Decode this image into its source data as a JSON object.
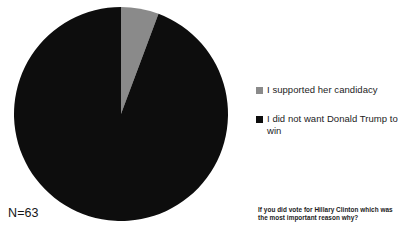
{
  "chart_data": {
    "type": "pie",
    "title": "",
    "categories": [
      "I supported her candidacy",
      "I did not want Donald Trump to win"
    ],
    "values": [
      5.7,
      94.3
    ],
    "value_unit": "percent",
    "colors": [
      "#8a8a8a",
      "#0d0d0d"
    ],
    "start_angle_deg": 0,
    "direction": "clockwise",
    "legend_position": "right",
    "grid": false,
    "annotations": {
      "sample_size": "N=63",
      "question": "If you did vote for Hillary Clinton which was the most important reason why?"
    }
  },
  "figure": {
    "sample_size_label": "N=63",
    "caption": "If you did vote for Hillary Clinton which was the most important reason why?",
    "legend": {
      "items": [
        {
          "label": "I supported her candidacy",
          "color": "#8a8a8a"
        },
        {
          "label": "I did not want Donald Trump to win",
          "color": "#0d0d0d"
        }
      ]
    },
    "slices": [
      {
        "name": "supported-her-candidacy",
        "label": "I supported her candidacy",
        "percent": 5.7,
        "color": "#8a8a8a"
      },
      {
        "name": "did-not-want-trump",
        "label": "I did not want Donald Trump to win",
        "percent": 94.3,
        "color": "#0d0d0d"
      }
    ]
  }
}
